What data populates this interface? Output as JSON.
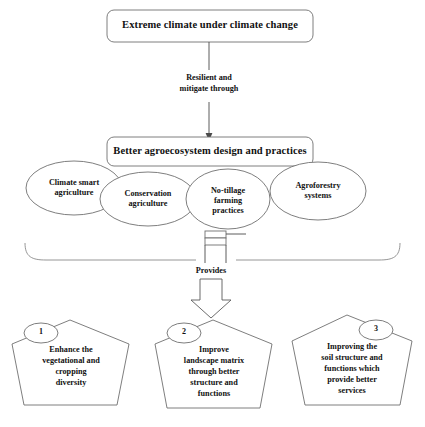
{
  "diagram": {
    "title_box": {
      "label": "Extreme climate under climate change"
    },
    "connector_label": "Resilient and\nmitigate through",
    "connector_label_line1": "Resilient and",
    "connector_label_line2": "mitigate through",
    "practices_box": {
      "label": "Better agroecosystem design and practices"
    },
    "practices": [
      {
        "label": "Climate smart\nagriculture",
        "line1": "Climate smart",
        "line2": "agriculture"
      },
      {
        "label": "Conservation\nagriculture",
        "line1": "Conservation",
        "line2": "agriculture"
      },
      {
        "label": "No-tillage\nfarming\npractices",
        "line1": "No-tillage",
        "line2": "farming",
        "line3": "practices"
      },
      {
        "label": "Agroforestry\nsystems",
        "line1": "Agroforestry",
        "line2": "systems"
      }
    ],
    "provides_label": "Provides",
    "outcomes": [
      {
        "number": "1",
        "badge_side": "left",
        "label": "Enhance the vegetational and cropping diversity",
        "lines": [
          "Enhance the",
          "vegetational and",
          "cropping",
          "diversity"
        ]
      },
      {
        "number": "2",
        "badge_side": "left",
        "label": "Improve landscape matrix through better structure and functions",
        "lines": [
          "Improve",
          "landscape matrix",
          "through better",
          "structure and",
          "functions"
        ]
      },
      {
        "number": "3",
        "badge_side": "right",
        "label": "Improving the soil structure and functions which provide better services",
        "lines": [
          "Improving the",
          "soil structure and",
          "functions which",
          "provide better",
          "services"
        ]
      }
    ],
    "colors": {
      "background": "#ffffff",
      "shape_stroke": "#6f6f6f",
      "connector_stroke": "#4a4a4a",
      "brace_stroke": "#8a8a8a",
      "text": "#111111"
    }
  }
}
